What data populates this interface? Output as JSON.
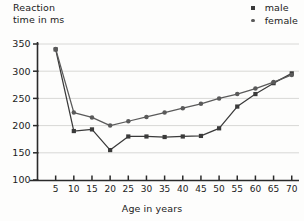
{
  "chart_data": {
    "type": "line",
    "title": "",
    "ylabel": "Reaction\ntime in ms",
    "xlabel": "Age in years",
    "x": [
      5,
      10,
      15,
      20,
      25,
      30,
      35,
      40,
      45,
      50,
      55,
      60,
      65,
      70
    ],
    "xlim": [
      0,
      72
    ],
    "ylim": [
      100,
      350
    ],
    "yticks": [
      100,
      150,
      200,
      250,
      300,
      350
    ],
    "xticks": [
      5,
      10,
      15,
      20,
      25,
      30,
      35,
      40,
      45,
      50,
      55,
      60,
      65,
      70
    ],
    "grid": true,
    "legend_position": "top-right",
    "series": [
      {
        "name": "male",
        "marker": "square",
        "color": "#3a3a3a",
        "values": [
          340,
          190,
          193,
          155,
          180,
          180,
          179,
          180,
          181,
          195,
          235,
          258,
          278,
          296
        ]
      },
      {
        "name": "female",
        "marker": "circle",
        "color": "#5a5a5a",
        "values": [
          341,
          224,
          215,
          200,
          208,
          216,
          224,
          232,
          240,
          250,
          258,
          268,
          280,
          293
        ]
      }
    ]
  },
  "legend": {
    "items": [
      {
        "label": "male",
        "marker": "square"
      },
      {
        "label": "female",
        "marker": "circle"
      }
    ]
  },
  "axes": {
    "y_title": "Reaction\ntime in ms",
    "x_title": "Age in years"
  }
}
